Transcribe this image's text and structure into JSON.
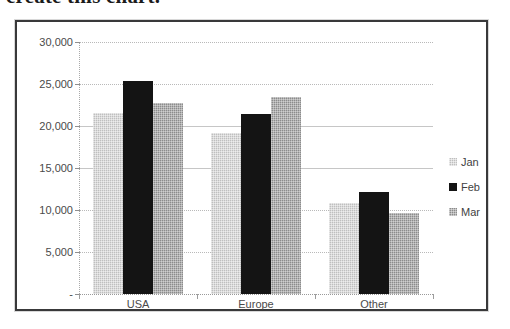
{
  "caption": {
    "text": "create this chart."
  },
  "chart_data": {
    "type": "bar",
    "title": "",
    "xlabel": "",
    "ylabel": "",
    "categories": [
      "USA",
      "Europe",
      "Other"
    ],
    "series": [
      {
        "name": "Jan",
        "color": "#bfbfbf",
        "values": [
          21600,
          19200,
          10800
        ]
      },
      {
        "name": "Feb",
        "color": "#141414",
        "values": [
          25300,
          21400,
          12200
        ]
      },
      {
        "name": "Mar",
        "color": "#8c8c8c",
        "values": [
          22700,
          23500,
          9600
        ]
      }
    ],
    "ylim": [
      0,
      30000
    ],
    "yticks": [
      0,
      5000,
      10000,
      15000,
      20000,
      25000,
      30000
    ],
    "ytick_labels": [
      "-",
      "5,000",
      "10,000",
      "15,000",
      "20,000",
      "25,000",
      "30,000"
    ],
    "grid": true,
    "legend_position": "right"
  },
  "frame": {
    "border_color": "#39393a",
    "background": "#ffffff"
  }
}
